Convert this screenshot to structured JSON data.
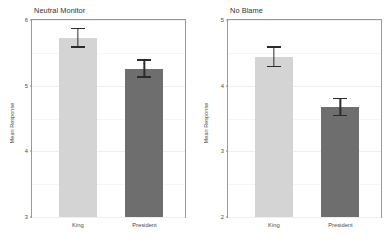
{
  "figure": {
    "panels": [
      {
        "key": "neutral_monitor",
        "title": "Neutral Monitor",
        "ylabel": "Mean Response",
        "ylim": [
          3,
          6
        ],
        "yticks": [
          "6",
          "5",
          "4",
          "3"
        ],
        "ytick_values": [
          6,
          5,
          4,
          3
        ],
        "categories": [
          "King",
          "President"
        ],
        "values": [
          5.72,
          5.25
        ],
        "ci_low": [
          5.58,
          5.12
        ],
        "ci_high": [
          5.88,
          5.4
        ]
      },
      {
        "key": "no_blame",
        "title": "No Blame",
        "ylabel": "Mean Response",
        "ylim": [
          2,
          5
        ],
        "yticks": [
          "5",
          "4",
          "3",
          "2"
        ],
        "ytick_values": [
          5,
          4,
          3,
          2
        ],
        "categories": [
          "King",
          "President"
        ],
        "values": [
          4.43,
          3.67
        ],
        "ci_low": [
          4.28,
          3.54
        ],
        "ci_high": [
          4.6,
          3.81
        ]
      }
    ]
  },
  "colors": {
    "bar_king": "#d4d4d4",
    "bar_president": "#6e6e6e",
    "error_bar": "#2b2b2b",
    "panel_border": "#9a9a9a",
    "gridline": "#eeeeee",
    "background": "#ffffff",
    "text": "#4a4a4a"
  },
  "chart_data": [
    {
      "type": "bar",
      "title": "Neutral Monitor",
      "xlabel": "",
      "ylabel": "Mean Response",
      "categories": [
        "King",
        "President"
      ],
      "values": [
        5.72,
        5.25
      ],
      "error_low": [
        5.58,
        5.12
      ],
      "error_high": [
        5.88,
        5.4
      ],
      "ylim": [
        3,
        6
      ],
      "yticks": [
        3,
        4,
        5,
        6
      ],
      "grid": true,
      "legend": "none",
      "series": [
        {
          "name": "Mean Response",
          "values": [
            5.72,
            5.25
          ]
        }
      ]
    },
    {
      "type": "bar",
      "title": "No Blame",
      "xlabel": "",
      "ylabel": "Mean Response",
      "categories": [
        "King",
        "President"
      ],
      "values": [
        4.43,
        3.67
      ],
      "error_low": [
        4.28,
        3.54
      ],
      "error_high": [
        4.6,
        3.81
      ],
      "ylim": [
        2,
        5
      ],
      "yticks": [
        2,
        3,
        4,
        5
      ],
      "grid": true,
      "legend": "none",
      "series": [
        {
          "name": "Mean Response",
          "values": [
            4.43,
            3.67
          ]
        }
      ]
    }
  ]
}
